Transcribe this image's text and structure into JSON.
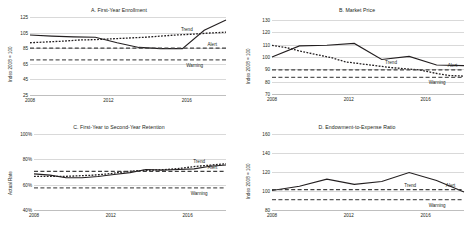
{
  "figure": {
    "panel_count": 4,
    "annotation_labels": {
      "trend": "Trend",
      "alert": "Alert",
      "warning": "Warning"
    },
    "colors": {
      "actual": "#231f20",
      "trend": "#231f20",
      "alert": "#404040",
      "warning": "#595959",
      "grid": "#d9d9d9"
    }
  },
  "chart_data": [
    {
      "type": "line",
      "title": "A. First-Year Enrollment",
      "xlabel": "",
      "ylabel": "Index 2008 = 100",
      "ylim": [
        25,
        125
      ],
      "yticks": [
        25,
        45,
        65,
        85,
        105,
        125
      ],
      "ytick_labels": [
        "25",
        "45",
        "65",
        "85",
        "105",
        "125"
      ],
      "xlim": [
        2008,
        2018
      ],
      "xticks": [
        2008,
        2012,
        2016
      ],
      "xtick_labels": [
        "2008",
        "2012",
        "2016"
      ],
      "grid": true,
      "legend": "inline-right",
      "x": [
        2008,
        2009,
        2010,
        2011,
        2012,
        2013,
        2014,
        2015,
        2016
      ],
      "series": [
        {
          "name": "Actual",
          "style": "solid",
          "values": [
            102,
            100.5,
            99.5,
            99,
            92,
            86,
            84.5,
            84.5,
            108,
            121
          ]
        },
        {
          "name": "Trend",
          "style": "dotted",
          "values": [
            92,
            93,
            94,
            95.5,
            96,
            97,
            98,
            99,
            100.5,
            102,
            103,
            104.5,
            105.5
          ]
        },
        {
          "name": "Alert",
          "style": "dashed",
          "value": 85
        },
        {
          "name": "Warning",
          "style": "dashed",
          "value": 70
        }
      ]
    },
    {
      "type": "line",
      "title": "B. Market Price",
      "xlabel": "",
      "ylabel": "Index 2008 = 100",
      "ylim": [
        70,
        130
      ],
      "yticks": [
        70,
        80,
        90,
        100,
        110,
        120,
        130
      ],
      "ytick_labels": [
        "70",
        "80",
        "90",
        "100",
        "110",
        "120",
        "130"
      ],
      "xlim": [
        2008,
        2018
      ],
      "xticks": [
        2008,
        2012,
        2016
      ],
      "xtick_labels": [
        "2008",
        "2012",
        "2016"
      ],
      "grid": true,
      "legend": "inline-right",
      "x": [
        2008,
        2009,
        2010,
        2011,
        2012,
        2013,
        2014,
        2015
      ],
      "series": [
        {
          "name": "Actual",
          "style": "solid",
          "values": [
            100,
            109,
            109.5,
            111,
            98,
            100.5,
            93.5,
            93
          ]
        },
        {
          "name": "Trend",
          "style": "dotted",
          "values": [
            109.5,
            107.5,
            104.5,
            102,
            99.5,
            96,
            94.5,
            93,
            91.5,
            90.5,
            89.5,
            87,
            85,
            84.5
          ]
        },
        {
          "name": "Alert",
          "style": "dashed",
          "value": 89.5
        },
        {
          "name": "Warning",
          "style": "dashed",
          "value": 83.5
        }
      ]
    },
    {
      "type": "line",
      "title": "C. First-Year to Second-Year Retention",
      "xlabel": "",
      "ylabel": "Actual Rate",
      "ylim": [
        40,
        100
      ],
      "yticks": [
        40,
        60,
        80,
        100
      ],
      "ytick_labels": [
        "40%",
        "60%",
        "80%",
        "100%"
      ],
      "xlim": [
        2008,
        2018
      ],
      "xticks": [
        2008,
        2012,
        2016
      ],
      "xtick_labels": [
        "2008",
        "2012",
        "2016"
      ],
      "grid": true,
      "legend": "inline-right",
      "x": [
        2008,
        2009,
        2010,
        2011,
        2012,
        2013,
        2014,
        2015,
        2016
      ],
      "series": [
        {
          "name": "Actual",
          "style": "solid",
          "values": [
            68.5,
            67.5,
            65.5,
            65.5,
            66.5,
            68,
            69.5,
            72,
            71.5,
            72,
            72.5,
            74.5,
            75.5
          ]
        },
        {
          "name": "Trend",
          "style": "dotted",
          "values": [
            66.5,
            66.5,
            66.5,
            67,
            67.5,
            68.5,
            70,
            71,
            71.5,
            72,
            73,
            74.5,
            75.5,
            76.5
          ]
        },
        {
          "name": "Alert",
          "style": "dashed",
          "value": 70.5
        },
        {
          "name": "Warning",
          "style": "dashed",
          "value": 57.5
        }
      ]
    },
    {
      "type": "line",
      "title": "D. Endowment-to-Expense Ratio",
      "xlabel": "",
      "ylabel": "Index 2008 = 100",
      "ylim": [
        80,
        160
      ],
      "yticks": [
        80,
        100,
        120,
        140,
        160
      ],
      "ytick_labels": [
        "80",
        "100",
        "120",
        "140",
        "160"
      ],
      "xlim": [
        2008,
        2018
      ],
      "xticks": [
        2008,
        2012,
        2016
      ],
      "xtick_labels": [
        "2008",
        "2012",
        "2016"
      ],
      "grid": true,
      "legend": "inline-right",
      "x": [
        2008,
        2009,
        2010,
        2011,
        2012,
        2013,
        2014,
        2015
      ],
      "series": [
        {
          "name": "Actual",
          "style": "solid",
          "values": [
            100.5,
            105,
            112.5,
            107,
            110,
            119.5,
            111,
            99
          ]
        },
        {
          "name": "Alert",
          "style": "dashed",
          "value": 101.5
        },
        {
          "name": "Warning",
          "style": "dashed",
          "value": 91
        }
      ]
    }
  ]
}
